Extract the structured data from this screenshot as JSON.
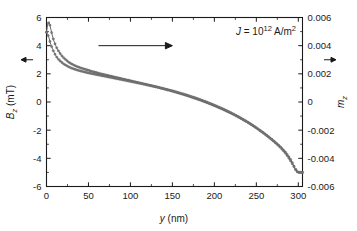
{
  "chart_data": {
    "type": "line",
    "title": "",
    "xlabel": "y (nm)",
    "ylabel": "B_z (mT)",
    "y2label": "m_z",
    "xlim": [
      0,
      305
    ],
    "ylim": [
      -6,
      6
    ],
    "y2lim": [
      -0.006,
      0.006
    ],
    "grid": false,
    "legend_position": "none",
    "xticks": [
      0,
      50,
      100,
      150,
      200,
      250,
      300
    ],
    "xticklabels": [
      "0",
      "50",
      "100",
      "150",
      "200",
      "250",
      "300"
    ],
    "yticks": [
      6,
      4,
      2,
      0,
      -2,
      -4,
      -6
    ],
    "yticklabels": [
      "6",
      "4",
      "2",
      "0",
      "-2",
      "-4",
      "-6"
    ],
    "y2ticks": [
      0.006,
      0.004,
      0.002,
      0,
      -0.002,
      -0.004,
      -0.006
    ],
    "y2ticklabels": [
      "0.006",
      "0.004",
      "0.002",
      "0",
      "-0.002",
      "-0.004",
      "-0.006"
    ],
    "xminor_count": 1,
    "yminor_count": 1,
    "annotations": [
      {
        "name": "current-density-annotation",
        "text_parts": {
          "symbol": "J",
          "equals": " = 10",
          "exponent": "12",
          "units": " A/m",
          "units_exponent": "2"
        },
        "x_data": 228,
        "y_data": 5.1
      },
      {
        "name": "right-pointing-arrow-annotation",
        "x_start": 62,
        "x_end": 150,
        "y_data": 4.0
      },
      {
        "name": "left-axis-arrow-marker",
        "y_data": 3.0
      },
      {
        "name": "right-axis-arrow-marker",
        "y_data": 0.003
      }
    ],
    "series": [
      {
        "name": "Bz-profile",
        "axis": "left",
        "color": "#6b6b6b",
        "x": [
          0,
          1.5,
          3,
          4.5,
          6,
          7.5,
          9,
          11,
          13,
          15,
          18,
          21,
          24,
          27,
          30,
          34,
          38,
          42,
          46,
          50,
          55,
          60,
          65,
          70,
          75,
          80,
          85,
          90,
          95,
          100,
          105,
          110,
          115,
          120,
          125,
          130,
          135,
          140,
          145,
          150,
          155,
          160,
          165,
          170,
          175,
          180,
          185,
          190,
          195,
          200,
          205,
          210,
          215,
          220,
          225,
          230,
          235,
          240,
          245,
          250,
          255,
          260,
          265,
          270,
          274,
          278,
          281,
          284,
          287,
          290,
          292,
          294,
          296,
          298,
          300
        ],
        "values": [
          4.95,
          5.55,
          5.7,
          5.35,
          4.95,
          4.6,
          4.3,
          4.0,
          3.75,
          3.55,
          3.3,
          3.1,
          2.95,
          2.8,
          2.7,
          2.58,
          2.48,
          2.4,
          2.32,
          2.25,
          2.16,
          2.08,
          2.0,
          1.93,
          1.86,
          1.79,
          1.72,
          1.65,
          1.58,
          1.51,
          1.44,
          1.37,
          1.3,
          1.23,
          1.16,
          1.09,
          1.01,
          0.93,
          0.85,
          0.77,
          0.68,
          0.59,
          0.5,
          0.4,
          0.3,
          0.2,
          0.09,
          -0.02,
          -0.14,
          -0.26,
          -0.39,
          -0.52,
          -0.66,
          -0.8,
          -0.95,
          -1.11,
          -1.28,
          -1.45,
          -1.64,
          -1.84,
          -2.05,
          -2.27,
          -2.5,
          -2.74,
          -2.94,
          -3.15,
          -3.33,
          -3.52,
          -3.74,
          -4.0,
          -4.2,
          -4.45,
          -4.7,
          -4.9,
          -5.0
        ]
      },
      {
        "name": "mz-profile",
        "axis": "right",
        "color": "#6b6b6b",
        "x": [
          0,
          1.5,
          3,
          4.5,
          6,
          7.5,
          9,
          11,
          13,
          15,
          18,
          21,
          24,
          27,
          30,
          34,
          38,
          42,
          46,
          50,
          60,
          70,
          80,
          90,
          100,
          110,
          120,
          130,
          140,
          150,
          160,
          170,
          180,
          190,
          200,
          210,
          220,
          230,
          240,
          250,
          260,
          270,
          278,
          284,
          288,
          292,
          295,
          298,
          300
        ],
        "values": [
          0.00495,
          0.0048,
          0.00455,
          0.0042,
          0.00395,
          0.00372,
          0.00352,
          0.0033,
          0.00312,
          0.00298,
          0.00282,
          0.00268,
          0.00258,
          0.00248,
          0.0024,
          0.00232,
          0.00224,
          0.00218,
          0.00212,
          0.00206,
          0.00194,
          0.00182,
          0.0017,
          0.00158,
          0.00146,
          0.00134,
          0.00121,
          0.00108,
          0.00094,
          0.00079,
          0.00062,
          0.00044,
          0.00024,
          2e-05,
          -0.00022,
          -0.00048,
          -0.00077,
          -0.00109,
          -0.00144,
          -0.00183,
          -0.00226,
          -0.00274,
          -0.00318,
          -0.00358,
          -0.00392,
          -0.0043,
          -0.00462,
          -0.00492,
          -0.005
        ]
      }
    ]
  }
}
